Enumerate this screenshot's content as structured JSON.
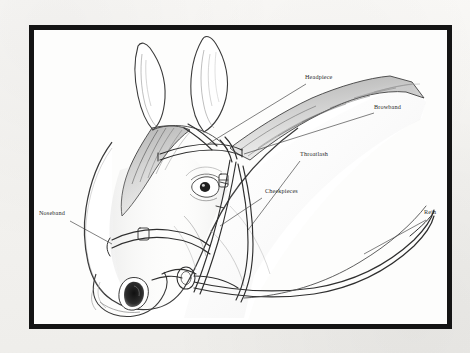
{
  "figure": {
    "frame_color": "#141414",
    "paper_color": "#f6f5f3",
    "plate_color": "#fdfdfc",
    "ink_color": "#2a2a2a"
  },
  "labels": [
    {
      "id": "headpiece",
      "text": "Headpiece",
      "leader": "line-to-crown-strap"
    },
    {
      "id": "browband",
      "text": "Browband",
      "leader": "line-to-forehead-strap"
    },
    {
      "id": "throatlash",
      "text": "Throatlash",
      "leader": "line-to-throat-strap"
    },
    {
      "id": "cheekpieces",
      "text": "Cheekpieces",
      "leader": "line-to-cheek-strap"
    },
    {
      "id": "noseband",
      "text": "Noseband",
      "leader": "line-to-nose-strap"
    },
    {
      "id": "rein",
      "text": "Rein",
      "leader": "line-to-rein"
    }
  ],
  "artwork": {
    "style": "pen-and-ink line drawing",
    "elements": [
      "left-ear",
      "right-ear",
      "forelock",
      "mane-crest",
      "eye",
      "muzzle",
      "nostril",
      "jaw",
      "neck",
      "bridle-headpiece",
      "bridle-browband",
      "bridle-throatlash",
      "bridle-cheekpieces",
      "bridle-noseband",
      "bit",
      "reins"
    ]
  }
}
